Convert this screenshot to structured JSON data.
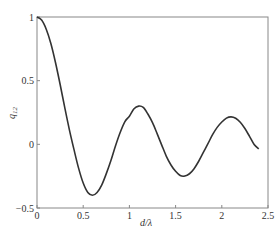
{
  "chart_data": {
    "type": "line",
    "title": "",
    "xlabel": "d/λ",
    "ylabel": "q12",
    "ylabel_main": "q",
    "ylabel_sub": "12",
    "xlim": [
      0,
      2.5
    ],
    "ylim": [
      -0.5,
      1
    ],
    "xticks": [
      0,
      0.5,
      1,
      1.5,
      2,
      2.5
    ],
    "xtick_labels": [
      "0",
      "0.5",
      "1",
      "1.5",
      "2",
      "2.5"
    ],
    "yticks": [
      -0.5,
      0,
      0.5,
      1
    ],
    "ytick_labels": [
      "−0.5",
      "0",
      "0.5",
      "1"
    ],
    "grid": false,
    "legend": null,
    "line_color": "#333333",
    "series": [
      {
        "name": "q12",
        "x": [
          0,
          0.05,
          0.1,
          0.15,
          0.2,
          0.25,
          0.3,
          0.35,
          0.4,
          0.45,
          0.5,
          0.55,
          0.6,
          0.65,
          0.7,
          0.75,
          0.8,
          0.85,
          0.9,
          0.95,
          1.0,
          1.05,
          1.1,
          1.15,
          1.2,
          1.25,
          1.3,
          1.35,
          1.4,
          1.45,
          1.5,
          1.55,
          1.6,
          1.65,
          1.7,
          1.75,
          1.8,
          1.85,
          1.9,
          1.95,
          2.0,
          2.05,
          2.1,
          2.15,
          2.2,
          2.25,
          2.3,
          2.35,
          2.4
        ],
        "values": [
          1.0,
          0.976,
          0.904,
          0.792,
          0.643,
          0.472,
          0.29,
          0.116,
          -0.04,
          -0.187,
          -0.304,
          -0.378,
          -0.4,
          -0.378,
          -0.32,
          -0.23,
          -0.127,
          -0.011,
          0.093,
          0.177,
          0.221,
          0.279,
          0.3,
          0.29,
          0.238,
          0.17,
          0.084,
          -0.006,
          -0.094,
          -0.162,
          -0.212,
          -0.245,
          -0.249,
          -0.231,
          -0.191,
          -0.133,
          -0.064,
          0.005,
          0.076,
          0.133,
          0.175,
          0.206,
          0.216,
          0.205,
          0.173,
          0.124,
          0.063,
          -0.001,
          -0.036
        ]
      }
    ]
  }
}
